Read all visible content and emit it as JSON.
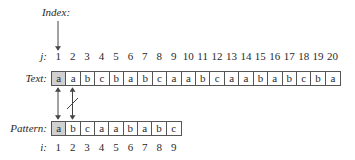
{
  "index_label": "Index:",
  "text_row": {
    "index_label": "j:",
    "label": "Text:",
    "indices": [
      "1",
      "2",
      "3",
      "4",
      "5",
      "6",
      "7",
      "8",
      "9",
      "10",
      "11",
      "12",
      "13",
      "14",
      "15",
      "16",
      "17",
      "18",
      "19",
      "20"
    ],
    "chars": [
      "a",
      "a",
      "b",
      "c",
      "b",
      "a",
      "b",
      "c",
      "a",
      "a",
      "b",
      "c",
      "a",
      "a",
      "b",
      "a",
      "b",
      "c",
      "b",
      "a"
    ],
    "highlighted": [
      0
    ]
  },
  "pattern_row": {
    "index_label": "i:",
    "label": "Pattern:",
    "indices": [
      "1",
      "2",
      "3",
      "4",
      "5",
      "6",
      "7",
      "8",
      "9"
    ],
    "chars": [
      "a",
      "b",
      "c",
      "a",
      "a",
      "b",
      "a",
      "b",
      "c"
    ],
    "highlighted": [
      0
    ]
  },
  "comparisons": [
    {
      "text_pos": 1,
      "pattern_pos": 1,
      "match": true
    },
    {
      "text_pos": 2,
      "pattern_pos": 2,
      "match": false
    }
  ],
  "colors": {
    "highlight": "#d0d0d0",
    "line": "#555555"
  }
}
